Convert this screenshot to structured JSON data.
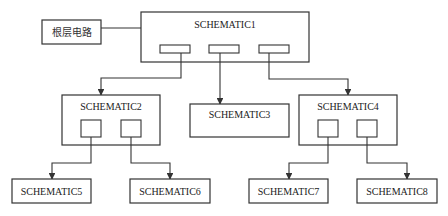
{
  "diagram": {
    "type": "hierarchical-schematic-tree",
    "root_label": "根层电路",
    "nodes": {
      "s1": "SCHEMATIC1",
      "s2": "SCHEMATIC2",
      "s3": "SCHEMATIC3",
      "s4": "SCHEMATIC4",
      "s5": "SCHEMATIC5",
      "s6": "SCHEMATIC6",
      "s7": "SCHEMATIC7",
      "s8": "SCHEMATIC8"
    },
    "edges": [
      {
        "from": "根层电路",
        "to": "SCHEMATIC1"
      },
      {
        "from": "SCHEMATIC1",
        "to": "SCHEMATIC2"
      },
      {
        "from": "SCHEMATIC1",
        "to": "SCHEMATIC3"
      },
      {
        "from": "SCHEMATIC1",
        "to": "SCHEMATIC4"
      },
      {
        "from": "SCHEMATIC2",
        "to": "SCHEMATIC5"
      },
      {
        "from": "SCHEMATIC2",
        "to": "SCHEMATIC6"
      },
      {
        "from": "SCHEMATIC4",
        "to": "SCHEMATIC7"
      },
      {
        "from": "SCHEMATIC4",
        "to": "SCHEMATIC8"
      }
    ],
    "colors": {
      "stroke": "#333333",
      "background": "#ffffff",
      "text": "#222222"
    }
  }
}
